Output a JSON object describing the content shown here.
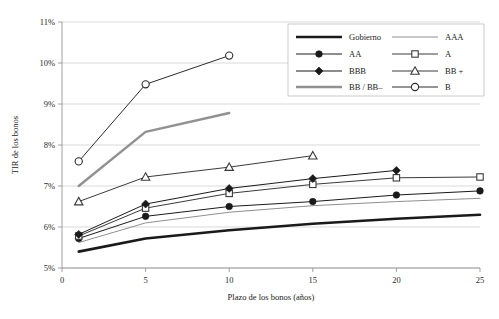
{
  "chart_data": {
    "type": "line",
    "title": "",
    "xlabel": "Plazo de los bonos (años)",
    "ylabel": "TIR de los bonos",
    "xlim": [
      0,
      25
    ],
    "ylim": [
      5,
      11
    ],
    "grid": true,
    "legend_position": "top-right",
    "x_ticks": [
      "0",
      "5",
      "10",
      "15",
      "20",
      "25"
    ],
    "x_tick_values": [
      0,
      5,
      10,
      15,
      20,
      25
    ],
    "y_ticks": [
      "5%",
      "6%",
      "7%",
      "8%",
      "9%",
      "10%",
      "11%"
    ],
    "y_tick_values": [
      5,
      6,
      7,
      8,
      9,
      10,
      11
    ],
    "series": [
      {
        "name": "Gobierno",
        "marker": "none",
        "color": "#1a1a1a",
        "width": 2.6,
        "x": [
          1,
          5,
          10,
          15,
          20,
          25
        ],
        "values": [
          5.4,
          5.72,
          5.92,
          6.08,
          6.2,
          6.3
        ]
      },
      {
        "name": "AAA",
        "marker": "none",
        "color": "#8f8f8f",
        "width": 1.0,
        "x": [
          1,
          5,
          10,
          15,
          20,
          25
        ],
        "values": [
          5.62,
          6.1,
          6.36,
          6.52,
          6.62,
          6.7
        ]
      },
      {
        "name": "AA",
        "marker": "circle-filled",
        "color": "#1a1a1a",
        "width": 1.0,
        "x": [
          1,
          5,
          10,
          15,
          20,
          25
        ],
        "values": [
          5.72,
          6.26,
          6.5,
          6.62,
          6.78,
          6.88
        ]
      },
      {
        "name": "A",
        "marker": "square-open",
        "color": "#3a3a3a",
        "width": 1.0,
        "x": [
          1,
          5,
          10,
          15,
          20,
          25
        ],
        "values": [
          5.78,
          6.46,
          6.82,
          7.04,
          7.2,
          7.22
        ]
      },
      {
        "name": "BBB",
        "marker": "diamond-filled",
        "color": "#1a1a1a",
        "width": 1.0,
        "x": [
          1,
          5,
          10,
          15,
          20
        ],
        "values": [
          5.82,
          6.56,
          6.94,
          7.18,
          7.38
        ]
      },
      {
        "name": "BB +",
        "marker": "triangle-open",
        "color": "#3a3a3a",
        "width": 1.0,
        "x": [
          1,
          5,
          10,
          15
        ],
        "values": [
          6.62,
          7.22,
          7.46,
          7.74
        ]
      },
      {
        "name": "BB / BB–",
        "marker": "none",
        "color": "#919191",
        "width": 2.4,
        "x": [
          1,
          5,
          10
        ],
        "values": [
          7.0,
          8.32,
          8.78
        ]
      },
      {
        "name": "B",
        "marker": "circle-open",
        "color": "#2b2b2b",
        "width": 1.0,
        "x": [
          1,
          5,
          10
        ],
        "values": [
          7.6,
          9.48,
          10.18
        ]
      }
    ],
    "legend": [
      {
        "label": "Gobierno",
        "marker": "none",
        "color": "#1a1a1a",
        "width": 2.6,
        "col": 0,
        "row": 0
      },
      {
        "label": "AAA",
        "marker": "none",
        "color": "#8f8f8f",
        "width": 1.0,
        "col": 1,
        "row": 0
      },
      {
        "label": "AA",
        "marker": "circle-filled",
        "color": "#1a1a1a",
        "width": 1.0,
        "col": 0,
        "row": 1
      },
      {
        "label": "A",
        "marker": "square-open",
        "color": "#3a3a3a",
        "width": 1.0,
        "col": 1,
        "row": 1
      },
      {
        "label": "BBB",
        "marker": "diamond-filled",
        "color": "#1a1a1a",
        "width": 1.0,
        "col": 0,
        "row": 2
      },
      {
        "label": "BB +",
        "marker": "triangle-open",
        "color": "#3a3a3a",
        "width": 1.0,
        "col": 1,
        "row": 2
      },
      {
        "label": "BB / BB–",
        "marker": "none",
        "color": "#919191",
        "width": 2.4,
        "col": 0,
        "row": 3
      },
      {
        "label": "B",
        "marker": "circle-open",
        "color": "#2b2b2b",
        "width": 1.0,
        "col": 1,
        "row": 3
      }
    ],
    "colors": {
      "grid": "#c9c9c9",
      "axis": "#8a8a8a",
      "text": "#1a1a1a",
      "background": "#ffffff",
      "legend_border": "#b5b5b5"
    }
  }
}
